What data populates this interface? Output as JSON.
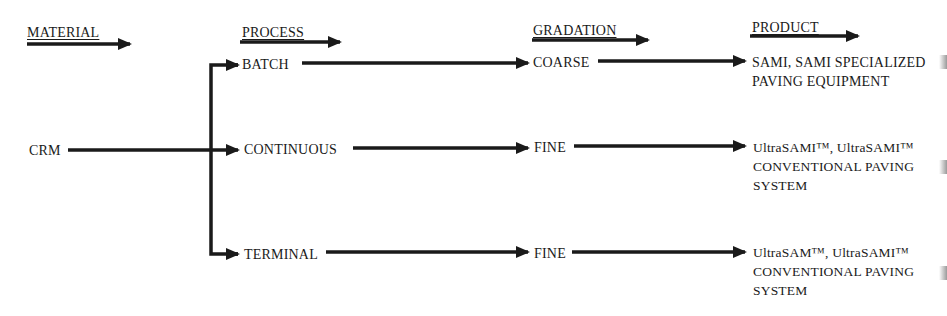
{
  "headers": {
    "material": "MATERIAL",
    "process": "PROCESS",
    "gradation": "GRADATION",
    "product": "PRODUCT"
  },
  "material": {
    "label": "CRM"
  },
  "processes": [
    {
      "label": "BATCH"
    },
    {
      "label": "CONTINUOUS"
    },
    {
      "label": "TERMINAL"
    }
  ],
  "gradations": [
    {
      "label": "COARSE"
    },
    {
      "label": "FINE"
    },
    {
      "label": "FINE"
    }
  ],
  "products": [
    {
      "label": "SAMI, SAMI SPECIALIZED\nPAVING EQUIPMENT"
    },
    {
      "label": "UltraSAMI™, UltraSAMI™\nCONVENTIONAL PAVING\nSYSTEM"
    },
    {
      "label": "UltraSAM™, UltraSAMI™\nCONVENTIONAL PAVING\nSYSTEM"
    }
  ],
  "colors": {
    "ink": "#1a1a1a",
    "background": "#ffffff"
  }
}
